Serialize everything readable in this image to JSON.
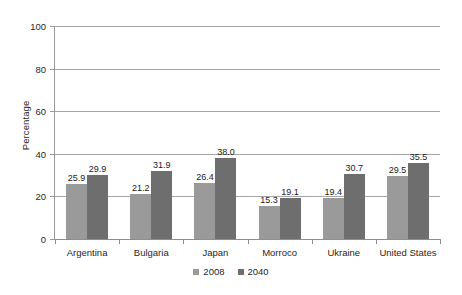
{
  "chart_data": {
    "type": "bar",
    "title": "",
    "subtitle": "",
    "xlabel": "",
    "ylabel": "Percentage",
    "ylim": [
      0,
      100
    ],
    "yticks": [
      "0",
      "20",
      "40",
      "60",
      "80",
      "100"
    ],
    "ytick_values": [
      0,
      20,
      40,
      60,
      80,
      100
    ],
    "grid": "horizontal",
    "legend_position": "bottom",
    "categories": [
      "Argentina",
      "Bulgaria",
      "Japan",
      "Morroco",
      "Ukraine",
      "United States"
    ],
    "series": [
      {
        "name": "2008",
        "color": "#9a9a9a",
        "values": [
          25.9,
          21.2,
          26.4,
          15.3,
          19.4,
          29.5
        ],
        "labels": [
          "25.9",
          "21.2",
          "26.4",
          "15.3",
          "19.4",
          "29.5"
        ]
      },
      {
        "name": "2040",
        "color": "#6e6e6e",
        "values": [
          29.9,
          31.9,
          38.0,
          19.1,
          30.7,
          35.5
        ],
        "labels": [
          "29.9",
          "31.9",
          "38.0",
          "19.1",
          "30.7",
          "35.5"
        ]
      }
    ]
  },
  "colors": {
    "series_2008": "#9a9a9a",
    "series_2040": "#6e6e6e",
    "gridline": "#a6a6a6",
    "axis": "#8f8f8f",
    "text": "#1f1f1f",
    "background": "#ffffff"
  }
}
